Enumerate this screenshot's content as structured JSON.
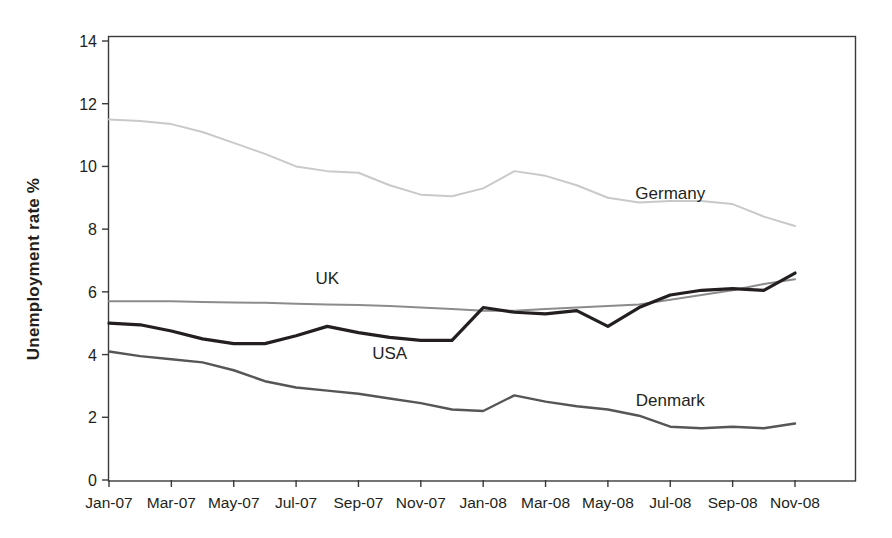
{
  "chart_data": {
    "type": "line",
    "title": "",
    "xlabel": "",
    "ylabel": "Unemployment rate %",
    "ylim": [
      0,
      14
    ],
    "yticks": [
      0,
      2,
      4,
      6,
      8,
      10,
      12,
      14
    ],
    "ytick_labels": [
      "0",
      "2",
      "4",
      "6",
      "8",
      "10",
      "12",
      "14"
    ],
    "grid": false,
    "legend_position": "inline-labels",
    "x": [
      "Jan-07",
      "Feb-07",
      "Mar-07",
      "Apr-07",
      "May-07",
      "Jun-07",
      "Jul-07",
      "Aug-07",
      "Sep-07",
      "Oct-07",
      "Nov-07",
      "Dec-07",
      "Jan-08",
      "Feb-08",
      "Mar-08",
      "Apr-08",
      "May-08",
      "Jun-08",
      "Jul-08",
      "Aug-08",
      "Sep-08",
      "Oct-08",
      "Nov-08"
    ],
    "xtick_labels": [
      "Jan-07",
      "Mar-07",
      "May-07",
      "Jul-07",
      "Sep-07",
      "Nov-07",
      "Jan-08",
      "Mar-08",
      "May-08",
      "Jul-08",
      "Sep-08",
      "Nov-08"
    ],
    "series": [
      {
        "name": "Germany",
        "color": "#c9c9c9",
        "width": 2.0,
        "label_x": "Jul-08",
        "label_y": 8.95,
        "values": [
          11.5,
          11.45,
          11.35,
          11.1,
          10.75,
          10.4,
          10.0,
          9.85,
          9.8,
          9.4,
          9.1,
          9.05,
          9.3,
          9.85,
          9.7,
          9.4,
          9.0,
          8.85,
          8.9,
          8.9,
          8.8,
          8.4,
          8.1
        ]
      },
      {
        "name": "UK",
        "color": "#8c8c8c",
        "width": 2.0,
        "label_x": "Aug-07",
        "label_y": 6.25,
        "values": [
          5.7,
          5.7,
          5.7,
          5.68,
          5.66,
          5.65,
          5.62,
          5.6,
          5.58,
          5.55,
          5.5,
          5.45,
          5.4,
          5.4,
          5.45,
          5.5,
          5.55,
          5.6,
          5.75,
          5.9,
          6.05,
          6.25,
          6.4
        ]
      },
      {
        "name": "USA",
        "color": "#231f20",
        "width": 3.2,
        "label_x": "Oct-07",
        "label_y": 3.85,
        "values": [
          5.0,
          4.95,
          4.75,
          4.5,
          4.35,
          4.35,
          4.6,
          4.9,
          4.7,
          4.55,
          4.45,
          4.45,
          5.5,
          5.35,
          5.3,
          5.4,
          4.9,
          5.5,
          5.9,
          6.05,
          6.1,
          6.05,
          6.6
        ]
      },
      {
        "name": "Denmark",
        "color": "#565656",
        "width": 2.4,
        "label_x": "Jul-08",
        "label_y": 2.35,
        "values": [
          4.1,
          3.95,
          3.85,
          3.75,
          3.5,
          3.15,
          2.95,
          2.85,
          2.75,
          2.6,
          2.45,
          2.25,
          2.2,
          2.7,
          2.5,
          2.35,
          2.25,
          2.05,
          1.7,
          1.65,
          1.7,
          1.65,
          1.8
        ]
      }
    ],
    "axis": {
      "frame_color": "#3a3a3a",
      "tick_color": "#3a3a3a"
    }
  }
}
